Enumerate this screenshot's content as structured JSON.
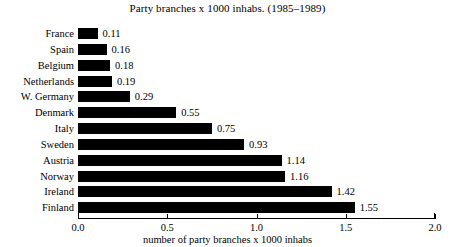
{
  "chart_data": {
    "type": "bar",
    "orientation": "horizontal",
    "title": "Party branches x 1000 inhabs. (1985–1989)",
    "xlabel": "number of party branches x 1000 inhabs",
    "ylabel": "",
    "categories": [
      "France",
      "Spain",
      "Belgium",
      "Netherlands",
      "W. Germany",
      "Denmark",
      "Italy",
      "Sweden",
      "Austria",
      "Norway",
      "Ireland",
      "Finland"
    ],
    "values": [
      0.11,
      0.16,
      0.18,
      0.19,
      0.29,
      0.55,
      0.75,
      0.93,
      1.14,
      1.16,
      1.42,
      1.55
    ],
    "value_labels": [
      "0.11",
      "0.16",
      "0.18",
      "0.19",
      "0.29",
      "0.55",
      "0.75",
      "0.93",
      "1.14",
      "1.16",
      "1.42",
      "1.55"
    ],
    "xlim": [
      0.0,
      2.0
    ],
    "xticks": [
      0.0,
      0.5,
      1.0,
      1.5,
      2.0
    ],
    "xtick_labels": [
      "0.0",
      "0.5",
      "1.0",
      "1.5",
      "2.0"
    ],
    "grid": false,
    "legend": false,
    "bar_color": "#000000",
    "background_color": "#ffffff",
    "text_color": "#000000"
  }
}
